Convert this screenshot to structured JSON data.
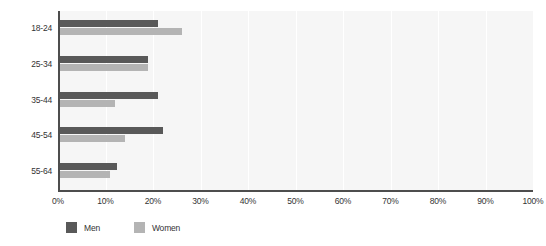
{
  "chart_data": {
    "type": "bar",
    "orientation": "horizontal",
    "title": "",
    "subtitle": "",
    "xlabel": "",
    "ylabel": "",
    "categories": [
      "18-24",
      "25-34",
      "35-44",
      "45-54",
      "55-64"
    ],
    "series": [
      {
        "name": "Men",
        "color": "#595959",
        "values": [
          21,
          19,
          21,
          22,
          12.5
        ]
      },
      {
        "name": "Women",
        "color": "#b4b4b4",
        "values": [
          26,
          19,
          12,
          14,
          11
        ]
      }
    ],
    "xlim": [
      0,
      100
    ],
    "xticks": [
      0,
      10,
      20,
      30,
      40,
      50,
      60,
      70,
      80,
      90,
      100
    ],
    "xtick_labels": [
      "0%",
      "10%",
      "20%",
      "30%",
      "40%",
      "50%",
      "60%",
      "70%",
      "80%",
      "90%",
      "100%"
    ],
    "value_format": "percent",
    "grid": {
      "vertical": true,
      "horizontal": false,
      "color": "#ffffff"
    },
    "plot_background": "#f6f6f6",
    "axis_color": "#4d4d4d",
    "legend": {
      "position": "bottom-left",
      "entries": [
        "Men",
        "Women"
      ]
    }
  }
}
